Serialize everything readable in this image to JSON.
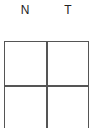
{
  "columns": [
    {
      "label": "N"
    },
    {
      "label": "T"
    }
  ],
  "grid": {
    "rows": 2,
    "cols": 2,
    "cells": [
      [
        "",
        ""
      ],
      [
        "",
        ""
      ]
    ]
  }
}
